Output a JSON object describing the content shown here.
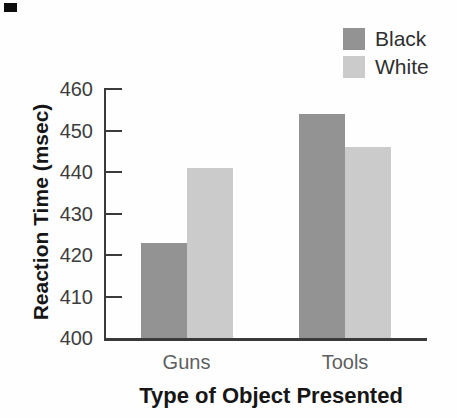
{
  "figure": {
    "background": "#fefefe",
    "scan_mark_color": "#0d0d0d"
  },
  "chart_data": {
    "type": "bar",
    "title": "",
    "categories": [
      "Guns",
      "Tools"
    ],
    "series": [
      {
        "name": "Black",
        "color": "#939393",
        "values": [
          423,
          454
        ]
      },
      {
        "name": "White",
        "color": "#cbcbcb",
        "values": [
          441,
          446
        ]
      }
    ],
    "xlabel": "Type of Object Presented",
    "ylabel": "Reaction Time (msec)",
    "ylim": [
      400,
      460
    ],
    "yticks": [
      400,
      410,
      420,
      430,
      440,
      450,
      460
    ],
    "grid": false,
    "legend_position": "top-right",
    "axis_color": "#3a3a3a",
    "tick_label_color": "#3d3d3d",
    "category_label_color": "#5e5e5e",
    "title_color": "#161616"
  }
}
